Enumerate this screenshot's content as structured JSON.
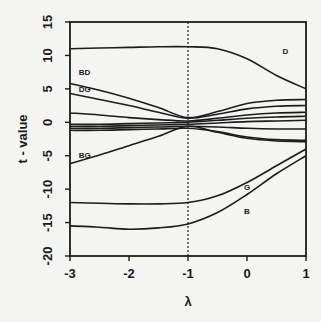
{
  "chart_data": {
    "type": "line",
    "title": "",
    "xlabel": "λ",
    "ylabel": "t - value",
    "xlim": [
      -3,
      1
    ],
    "ylim": [
      -20,
      15
    ],
    "x_ticks": [
      "-3",
      "-2",
      "-1",
      "0",
      "1"
    ],
    "y_ticks": [
      "-20",
      "-15",
      "-10",
      "-5",
      "0",
      "5",
      "10",
      "15"
    ],
    "grid": false,
    "legend": "none (inline curve labels)",
    "vertical_reference_line": {
      "x": -1,
      "style": "dotted"
    },
    "x": [
      -3,
      -2.5,
      -2,
      -1.5,
      -1,
      -0.5,
      0,
      0.5,
      1
    ],
    "series": [
      {
        "name": "D",
        "values": [
          11,
          11.1,
          11.2,
          11.3,
          11.3,
          11.0,
          9.5,
          7.0,
          5.0
        ]
      },
      {
        "name": "BD",
        "values": [
          5.8,
          4.8,
          3.6,
          2.2,
          0.7,
          1.6,
          2.8,
          3.3,
          3.4
        ]
      },
      {
        "name": "DG",
        "values": [
          4.3,
          3.4,
          2.5,
          1.5,
          0.6,
          1.2,
          2.0,
          2.4,
          2.5
        ]
      },
      {
        "name": "",
        "values": [
          1.4,
          1.1,
          0.7,
          0.4,
          0.2,
          0.6,
          1.1,
          1.4,
          1.5
        ]
      },
      {
        "name": "",
        "values": [
          -0.3,
          -0.3,
          -0.2,
          -0.1,
          0.0,
          0.3,
          0.6,
          0.8,
          0.9
        ]
      },
      {
        "name": "",
        "values": [
          -0.6,
          -0.6,
          -0.5,
          -0.4,
          -0.3,
          -0.1,
          0.1,
          0.2,
          0.3
        ]
      },
      {
        "name": "",
        "values": [
          -0.9,
          -0.9,
          -0.8,
          -0.7,
          -0.6,
          -0.7,
          -0.9,
          -1.0,
          -1.0
        ]
      },
      {
        "name": "",
        "values": [
          -1.2,
          -1.2,
          -1.1,
          -1.0,
          -0.9,
          -1.4,
          -2.2,
          -2.6,
          -2.7
        ]
      },
      {
        "name": "BG",
        "values": [
          -6.2,
          -4.9,
          -3.5,
          -2.1,
          -0.6,
          -1.5,
          -2.4,
          -2.8,
          -2.9
        ]
      },
      {
        "name": "G",
        "values": [
          -12.0,
          -12.1,
          -12.2,
          -12.2,
          -12.0,
          -11.0,
          -9.0,
          -6.5,
          -4.0
        ]
      },
      {
        "name": "B",
        "values": [
          -15.5,
          -15.7,
          -16.0,
          -15.8,
          -15.2,
          -13.5,
          -10.8,
          -7.7,
          -5.0
        ]
      }
    ],
    "curve_labels": [
      {
        "text": "D",
        "x": 0.6,
        "y": 10.2
      },
      {
        "text": "BD",
        "x": -2.85,
        "y": 7.0
      },
      {
        "text": "DG",
        "x": -2.85,
        "y": 4.6
      },
      {
        "text": "BG",
        "x": -2.85,
        "y": -5.3
      },
      {
        "text": "G",
        "x": -0.05,
        "y": -10.2
      },
      {
        "text": "B",
        "x": -0.05,
        "y": -13.7
      }
    ]
  },
  "colors": {
    "background": "#f4f4f2",
    "ink": "#1c1c1c"
  }
}
